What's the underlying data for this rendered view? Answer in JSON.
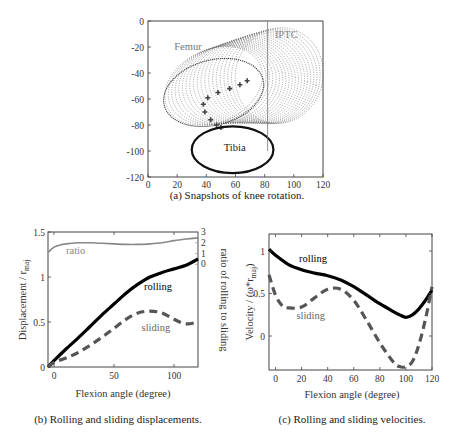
{
  "chart_data": [
    {
      "id": "a",
      "type": "scatter",
      "title": "",
      "caption": "(a) Snapshots of knee rotation.",
      "xlabel": "",
      "ylabel": "",
      "xlim": [
        0,
        120
      ],
      "ylim": [
        -120,
        0
      ],
      "xticks": [
        "0",
        "20",
        "40",
        "60",
        "80",
        "100",
        "120"
      ],
      "yticks": [
        "0",
        "-20",
        "-40",
        "-60",
        "-80",
        "-100",
        "-120"
      ],
      "grid": false,
      "annotations": [
        {
          "text": "Femur",
          "x": 18,
          "y": -22,
          "color": "#777777"
        },
        {
          "text": "IPTC",
          "x": 87,
          "y": -13,
          "color": "#888888"
        },
        {
          "text": "Tibia",
          "x": 52,
          "y": -100,
          "color": "#222222"
        }
      ],
      "femur_snapshots": {
        "count": 20,
        "start_center": [
          45,
          -50
        ],
        "end_center": [
          90,
          -42
        ],
        "rx": [
          35,
          30
        ],
        "ry": [
          28,
          37
        ],
        "color": "#555555"
      },
      "contact_path": {
        "x": [
          68,
          63,
          56,
          48,
          41,
          38,
          39,
          43,
          47,
          50
        ],
        "y": [
          -46,
          -49,
          -52,
          -55,
          -59,
          -64,
          -70,
          -76,
          -80,
          -82
        ]
      },
      "tibia": {
        "cx": 58,
        "cy": -99,
        "rx": 28,
        "ry": 18
      },
      "iptc_line_x": 82,
      "iptc_line_y": [
        0,
        -100
      ]
    },
    {
      "id": "b",
      "type": "line",
      "caption": "(b) Rolling and sliding displacements.",
      "xlabel": "Flexion angle (degree)",
      "ylabel": "Displacement / r_maj",
      "ylabel_main": "Displacement / r",
      "ylabel_sub": "maj",
      "y2label": "ratio of rolling to sliding",
      "xlim": [
        -5,
        120
      ],
      "ylim": [
        0,
        1.5
      ],
      "y2lim": [
        -9.5,
        3
      ],
      "xticks": [
        "0",
        "50",
        "100"
      ],
      "yticks": [
        "0",
        "0.5",
        "1",
        "1.5"
      ],
      "y2ticks": [
        "0",
        "1",
        "2",
        "3"
      ],
      "grid": false,
      "series": [
        {
          "name": "rolling",
          "style": "solid",
          "color": "#000000",
          "width": 3.2,
          "x": [
            -5,
            0,
            10,
            20,
            30,
            40,
            50,
            60,
            70,
            80,
            90,
            100,
            110,
            120
          ],
          "values": [
            0,
            0.07,
            0.2,
            0.32,
            0.45,
            0.58,
            0.7,
            0.82,
            0.92,
            1.0,
            1.05,
            1.09,
            1.13,
            1.2
          ]
        },
        {
          "name": "sliding",
          "style": "dashed",
          "color": "#555555",
          "width": 3.2,
          "x": [
            -5,
            0,
            10,
            20,
            30,
            40,
            50,
            60,
            70,
            80,
            90,
            100,
            110,
            120
          ],
          "values": [
            0,
            0.05,
            0.1,
            0.16,
            0.24,
            0.33,
            0.43,
            0.53,
            0.6,
            0.62,
            0.6,
            0.53,
            0.48,
            0.5
          ]
        },
        {
          "name": "ratio",
          "style": "solid",
          "color": "#888888",
          "width": 1.6,
          "axis": "right",
          "x": [
            -5,
            0,
            5,
            10,
            20,
            30,
            40,
            50,
            60,
            70,
            80,
            90,
            100,
            110,
            120
          ],
          "values": [
            1.1,
            1.6,
            1.8,
            1.9,
            2.0,
            2.0,
            1.95,
            1.9,
            1.85,
            1.85,
            1.9,
            2.0,
            2.2,
            2.35,
            2.45
          ]
        }
      ],
      "annotations": [
        {
          "text": "ratio",
          "x": 10,
          "y": 1.26,
          "color": "#888888"
        },
        {
          "text": "rolling",
          "x": 75,
          "y": 0.86,
          "color": "#000000"
        },
        {
          "text": "sliding",
          "x": 73,
          "y": 0.4,
          "color": "#666666"
        }
      ]
    },
    {
      "id": "c",
      "type": "line",
      "caption": "(c)  Rolling and sliding velocities.",
      "xlabel": "Flexion angle (degree)",
      "ylabel": "Velocity / (ω*r_maj)",
      "ylabel_main": "Velocity / (ω*r",
      "ylabel_sub": "maj",
      "ylabel_end": ")",
      "xlim": [
        -5,
        120
      ],
      "ylim": [
        -0.4,
        1.2
      ],
      "xticks": [
        "0",
        "20",
        "40",
        "60",
        "80",
        "100",
        "120"
      ],
      "yticks": [
        "0",
        "0.5",
        "1"
      ],
      "grid": false,
      "series": [
        {
          "name": "rolling",
          "style": "solid",
          "color": "#000000",
          "width": 3.2,
          "x": [
            -5,
            0,
            10,
            20,
            30,
            40,
            50,
            60,
            70,
            80,
            90,
            95,
            100,
            105,
            110,
            115,
            120
          ],
          "values": [
            1.02,
            0.95,
            0.84,
            0.78,
            0.74,
            0.71,
            0.66,
            0.58,
            0.48,
            0.38,
            0.29,
            0.25,
            0.22,
            0.25,
            0.32,
            0.42,
            0.54
          ]
        },
        {
          "name": "sliding",
          "style": "dashed",
          "color": "#555555",
          "width": 3.2,
          "x": [
            -5,
            0,
            5,
            10,
            20,
            30,
            40,
            50,
            60,
            70,
            80,
            90,
            95,
            100,
            105,
            110,
            115,
            120
          ],
          "values": [
            0.72,
            0.48,
            0.36,
            0.33,
            0.34,
            0.45,
            0.55,
            0.55,
            0.42,
            0.18,
            -0.08,
            -0.3,
            -0.36,
            -0.36,
            -0.3,
            -0.1,
            0.2,
            0.58
          ]
        }
      ],
      "annotations": [
        {
          "text": "rolling",
          "x": 18,
          "y": 0.87,
          "color": "#000000"
        },
        {
          "text": "sliding",
          "x": 16,
          "y": 0.2,
          "color": "#666666"
        }
      ]
    }
  ],
  "captions": {
    "a": "(a) Snapshots of knee rotation.",
    "b": "(b) Rolling and sliding displacements.",
    "c": "(c)  Rolling and sliding velocities."
  }
}
